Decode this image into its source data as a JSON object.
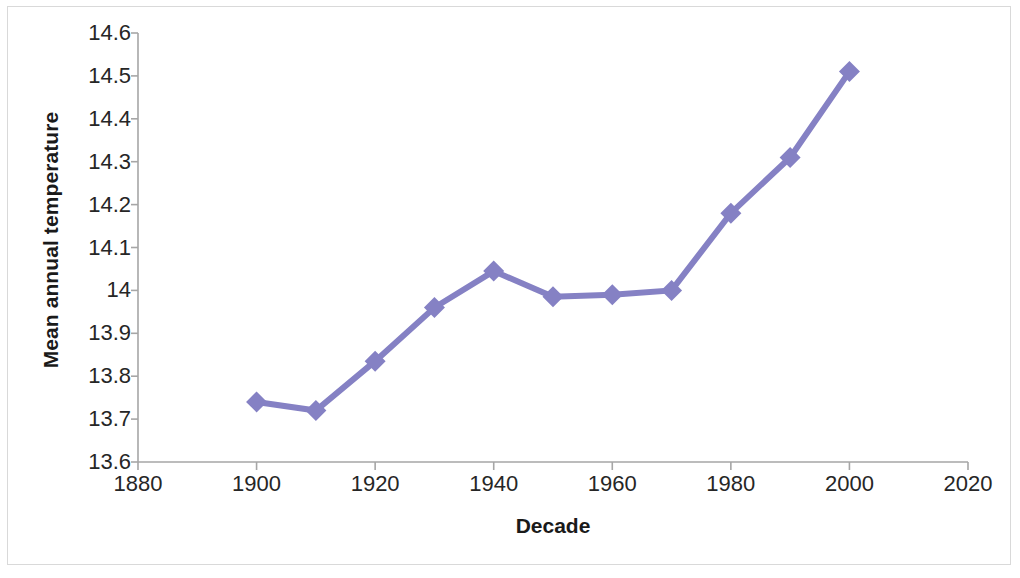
{
  "chart_data": {
    "type": "line",
    "title": "",
    "xlabel": "Decade",
    "ylabel": "Mean annual temperature",
    "x": [
      1900,
      1910,
      1920,
      1930,
      1940,
      1950,
      1960,
      1970,
      1980,
      1990,
      2000
    ],
    "values": [
      13.74,
      13.72,
      13.835,
      13.96,
      14.045,
      13.985,
      13.99,
      14.0,
      14.18,
      14.31,
      14.51
    ],
    "series": [
      {
        "name": "Mean annual temperature",
        "values": [
          13.74,
          13.72,
          13.835,
          13.96,
          14.045,
          13.985,
          13.99,
          14.0,
          14.18,
          14.31,
          14.51
        ]
      }
    ],
    "xlim": [
      1880,
      2020
    ],
    "ylim": [
      13.6,
      14.6
    ],
    "x_ticks": [
      "1880",
      "1900",
      "1920",
      "1940",
      "1960",
      "1980",
      "2000",
      "2020"
    ],
    "x_tick_values": [
      1880,
      1900,
      1920,
      1940,
      1960,
      1980,
      2000,
      2020
    ],
    "y_ticks": [
      "14.6",
      "14.5",
      "14.4",
      "14.3",
      "14.2",
      "14.1",
      "14",
      "13.9",
      "13.8",
      "13.7",
      "13.6"
    ],
    "y_tick_values": [
      14.6,
      14.5,
      14.4,
      14.3,
      14.2,
      14.1,
      14.0,
      13.9,
      13.8,
      13.7,
      13.6
    ],
    "grid": false,
    "legend": "none",
    "marker": "diamond",
    "series_color": "#8581c4",
    "axis_color": "#a6a6a6",
    "text_color": "#262626",
    "border_color": "#d9d9d9",
    "background": "#ffffff"
  }
}
